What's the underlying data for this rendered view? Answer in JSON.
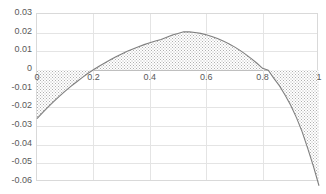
{
  "chart_data": {
    "type": "area",
    "title": "",
    "xlabel": "",
    "ylabel": "",
    "xlim": [
      0,
      1
    ],
    "ylim": [
      -0.06,
      0.03
    ],
    "grid": true,
    "legend": false,
    "fill": "hatched-dotted-gray",
    "y_ticks": [
      "0.03",
      "0.02",
      "0.01",
      "0",
      "-0.01",
      "-0.02",
      "-0.03",
      "-0.04",
      "-0.05",
      "-0.06"
    ],
    "y_tick_values": [
      0.03,
      0.02,
      0.01,
      0,
      -0.01,
      -0.02,
      -0.03,
      -0.04,
      -0.05,
      -0.06
    ],
    "x_ticks": [
      "0",
      "0.2",
      "0.4",
      "0.6",
      "0.8",
      "1"
    ],
    "x_tick_values": [
      0,
      0.2,
      0.4,
      0.6,
      0.8,
      1
    ],
    "zero_crossings": [
      0.157,
      0.82
    ],
    "peak": {
      "x": 0.52,
      "y": 0.0205
    },
    "series": [
      {
        "name": "series1",
        "x": [
          0.0,
          0.02,
          0.04,
          0.06,
          0.08,
          0.1,
          0.12,
          0.14,
          0.16,
          0.18,
          0.2,
          0.22,
          0.24,
          0.26,
          0.28,
          0.3,
          0.32,
          0.34,
          0.36,
          0.38,
          0.4,
          0.42,
          0.44,
          0.46,
          0.48,
          0.5,
          0.52,
          0.54,
          0.56,
          0.58,
          0.6,
          0.62,
          0.64,
          0.66,
          0.68,
          0.7,
          0.72,
          0.74,
          0.76,
          0.78,
          0.8,
          0.82,
          0.84,
          0.86,
          0.88,
          0.9,
          0.92,
          0.94,
          0.96,
          0.98,
          1.0
        ],
        "y": [
          -0.026,
          -0.0228,
          -0.0197,
          -0.0168,
          -0.014,
          -0.0113,
          -0.0088,
          -0.0064,
          -0.0041,
          -0.0019,
          0.0001,
          0.002,
          0.0038,
          0.0055,
          0.0071,
          0.0086,
          0.01,
          0.0113,
          0.0125,
          0.0136,
          0.0146,
          0.0155,
          0.0163,
          0.0176,
          0.0187,
          0.0196,
          0.0205,
          0.0204,
          0.0201,
          0.0196,
          0.0189,
          0.018,
          0.0169,
          0.0156,
          0.0141,
          0.0124,
          0.0105,
          0.0084,
          0.0061,
          0.0036,
          0.0009,
          -0.0001,
          -0.0045,
          -0.0085,
          -0.0135,
          -0.019,
          -0.0255,
          -0.033,
          -0.042,
          -0.0515,
          -0.062
        ]
      }
    ]
  }
}
